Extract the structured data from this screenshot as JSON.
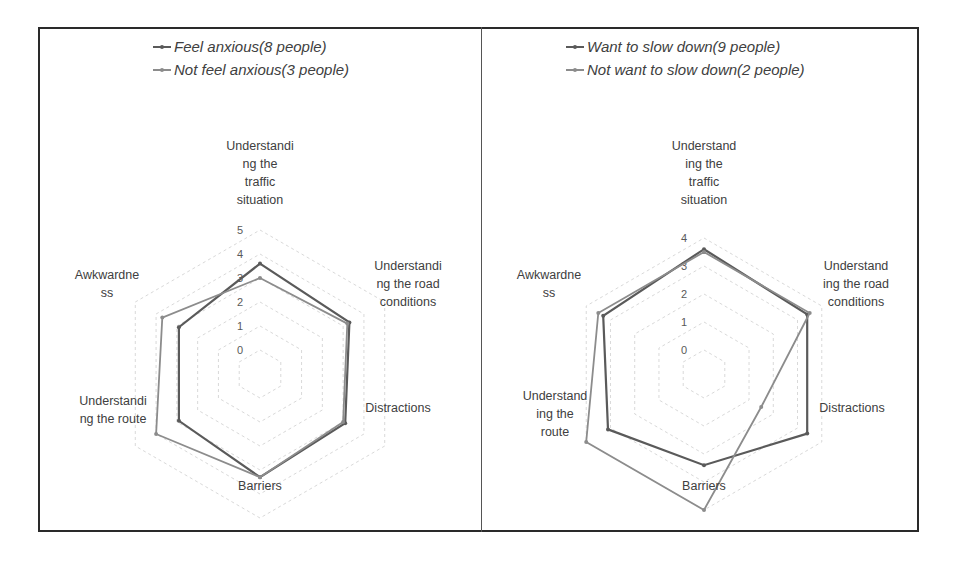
{
  "chart_data": [
    {
      "type": "radar",
      "title": "",
      "categories": [
        "Understanding the traffic situation",
        "Understanding the road conditions",
        "Distractions",
        "Barriers",
        "Understanding the route",
        "Awkwardness"
      ],
      "category_labels_wrapped": [
        [
          "Understandi",
          "ng the",
          "traffic",
          "situation"
        ],
        [
          "Understandi",
          "ng the road",
          "conditions"
        ],
        [
          "Distractions"
        ],
        [
          "Barriers"
        ],
        [
          "Understandi",
          "ng the route"
        ],
        [
          "Awkwardne",
          "ss"
        ]
      ],
      "series": [
        {
          "name": "Feel anxious(8 people)",
          "color": "#5a5a5a",
          "values": [
            3.6,
            3.3,
            3.1,
            3.3,
            2.9,
            2.9
          ]
        },
        {
          "name": "Not feel anxious(3 people)",
          "color": "#8c8c8c",
          "values": [
            3.0,
            3.2,
            3.0,
            3.3,
            4.0,
            3.7
          ]
        }
      ],
      "rlim": [
        0,
        5
      ],
      "ticks": [
        "0",
        "1",
        "2",
        "3",
        "4",
        "5"
      ],
      "legend_position": "top",
      "grid": true
    },
    {
      "type": "radar",
      "title": "",
      "categories": [
        "Understanding the traffic situation",
        "Understanding the road conditions",
        "Distractions",
        "Barriers",
        "Understanding the route",
        "Awkwardness"
      ],
      "category_labels_wrapped": [
        [
          "Understand",
          "ing the",
          "traffic",
          "situation"
        ],
        [
          "Understand",
          "ing the road",
          "conditions"
        ],
        [
          "Distractions"
        ],
        [
          "Barriers"
        ],
        [
          "Understand",
          "ing the",
          "route"
        ],
        [
          "Awkwardne",
          "ss"
        ]
      ],
      "series": [
        {
          "name": "Want to slow down(9 people)",
          "color": "#5a5a5a",
          "values": [
            3.6,
            3.4,
            3.4,
            2.4,
            3.1,
            3.3
          ]
        },
        {
          "name": "Not want to slow down(2 people)",
          "color": "#8c8c8c",
          "values": [
            3.5,
            3.5,
            1.5,
            4.0,
            4.0,
            3.5
          ]
        }
      ],
      "rlim": [
        0,
        4
      ],
      "ticks": [
        "0",
        "1",
        "2",
        "3",
        "4"
      ],
      "legend_position": "top",
      "grid": true
    }
  ]
}
